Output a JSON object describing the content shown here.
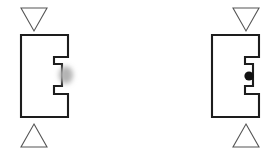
{
  "scene": {
    "title": "Crowding stimulus pair",
    "background_color": "#ffffff",
    "width": 280,
    "height": 154,
    "description": "Two flanked letter-E stimuli: left with a blurred grey probe dot, right with a sharp black probe dot"
  },
  "palette": {
    "letter_stroke": "#1d1d1d",
    "flanker_stroke": "#555555",
    "probe_sharp_color": "#111111",
    "probe_blur_color": "#b4b4b4",
    "background": "#ffffff"
  },
  "stimuli": [
    {
      "id": "left",
      "name": "blurred-probe-stimulus",
      "letter": "E",
      "letter_orientation": "upright",
      "top_flanker": {
        "shape": "triangle",
        "direction": "down",
        "fill": "none",
        "stroke": "#555555"
      },
      "bottom_flanker": {
        "shape": "triangle",
        "direction": "up",
        "fill": "none",
        "stroke": "#555555"
      },
      "probe": {
        "shape": "dot",
        "rendering": "blurred",
        "color": "#b4b4b4",
        "diameter_px": 14,
        "position": "right of middle arm"
      }
    },
    {
      "id": "right",
      "name": "sharp-probe-stimulus",
      "letter": "E",
      "letter_orientation": "upright",
      "top_flanker": {
        "shape": "triangle",
        "direction": "down",
        "fill": "none",
        "stroke": "#555555"
      },
      "bottom_flanker": {
        "shape": "triangle",
        "direction": "up",
        "fill": "none",
        "stroke": "#555555"
      },
      "probe": {
        "shape": "dot",
        "rendering": "sharp",
        "color": "#111111",
        "diameter_px": 9,
        "position": "right of middle arm"
      }
    }
  ],
  "geometry": {
    "letter_e_path": "M 21 35 L 68 35 L 68 57 L 54 57 L 54 64 L 62 64 L 62 86 L 54 86 L 54 94 L 68 94 L 68 117 L 21 117 Z",
    "triangle_down_points": "21,8 47,8 34,31",
    "triangle_up_points": "34,124 47,147 21,147",
    "letter_e_path_right": "M 72 35 L 119 35 L 119 57 L 105 57 L 105 64 L 113 64 L 113 86 L 105 86 L 105 94 L 119 94 L 119 117 L 72 117 Z",
    "triangle_down_points_right": "93,8 119,8 106,31",
    "triangle_up_points_right": "106,124 119,147 93,147"
  }
}
